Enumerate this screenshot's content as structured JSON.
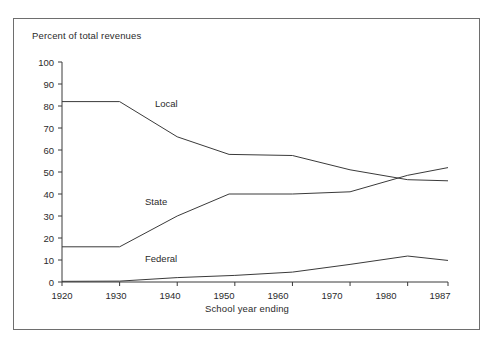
{
  "chart_data": {
    "type": "line",
    "title": "",
    "ylabel": "Percent of total revenues",
    "xlabel": "School year ending",
    "grid": false,
    "legend_position": "inline-labels",
    "xlim": [
      1920,
      1987
    ],
    "ylim": [
      0,
      100
    ],
    "yticks": [
      0,
      10,
      20,
      30,
      40,
      50,
      60,
      70,
      80,
      90,
      100
    ],
    "xticks": [
      1920,
      1930,
      1940,
      1950,
      1960,
      1970,
      1980,
      1987
    ],
    "xtick_labels": [
      "1920",
      "1930",
      "1940",
      "1950",
      "1960",
      "1970",
      "1980",
      "1987"
    ],
    "ytick_labels": [
      "0",
      "10",
      "20",
      "30",
      "40",
      "50",
      "60",
      "70",
      "80",
      "90",
      "100"
    ],
    "series": [
      {
        "name": "Local",
        "x": [
          1920,
          1930,
          1940,
          1949,
          1960,
          1970,
          1980,
          1987
        ],
        "values": [
          82,
          82,
          66,
          58,
          57.5,
          51,
          46.5,
          46
        ]
      },
      {
        "name": "State",
        "x": [
          1920,
          1930,
          1940,
          1949,
          1960,
          1970,
          1980,
          1987
        ],
        "values": [
          16,
          16,
          30,
          40,
          40,
          41,
          48.5,
          52
        ]
      },
      {
        "name": "Federal",
        "x": [
          1920,
          1930,
          1940,
          1950,
          1960,
          1970,
          1980,
          1987
        ],
        "values": [
          0.3,
          0.4,
          2,
          3,
          4.5,
          8,
          11.8,
          9.8
        ]
      }
    ]
  },
  "chart": {
    "axis_title": "Percent of total revenues",
    "xaxis_title": "School year ending",
    "series_labels": {
      "local": "Local",
      "state": "State",
      "federal": "Federal"
    },
    "ytick_labels": [
      "100",
      "90",
      "80",
      "70",
      "60",
      "50",
      "40",
      "30",
      "20",
      "10",
      "0"
    ],
    "xtick_labels": [
      "1920",
      "1930",
      "1940",
      "1950",
      "1960",
      "1970",
      "1980",
      "1987"
    ],
    "colors": {
      "line": "#3a3a3a",
      "axis": "#3a3a3a",
      "frame": "#6e6e6e",
      "text": "#2b2b2b",
      "background": "#ffffff"
    }
  }
}
